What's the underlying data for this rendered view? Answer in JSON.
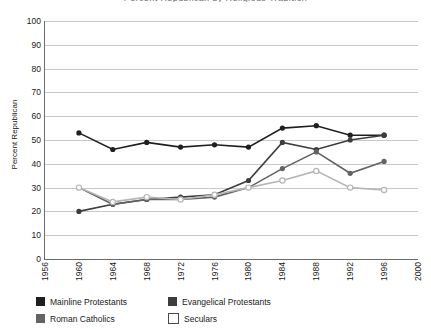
{
  "chart_data": {
    "type": "line",
    "title": "Percent Republican by Religious Tradition",
    "xlabel": "",
    "ylabel": "Percent Republican",
    "x": [
      1960,
      1964,
      1968,
      1972,
      1976,
      1980,
      1984,
      1988,
      1992,
      1996
    ],
    "xlim": [
      1956,
      2000
    ],
    "ylim": [
      0,
      100
    ],
    "xticks": [
      "1956",
      "1960",
      "1964",
      "1968",
      "1972",
      "1976",
      "1980",
      "1984",
      "1988",
      "1992",
      "1996",
      "2000"
    ],
    "yticks": [
      "0",
      "10",
      "20",
      "30",
      "40",
      "50",
      "60",
      "70",
      "80",
      "90",
      "100"
    ],
    "grid": true,
    "legend_position": "bottom-left",
    "series": [
      {
        "name": "Mainline Protestants",
        "color": "#1f1f1f",
        "marker": "filled-circle",
        "values": [
          53,
          46,
          49,
          47,
          48,
          47,
          55,
          56,
          52,
          52
        ]
      },
      {
        "name": "Evangelical Protestants",
        "color": "#3d3d3d",
        "marker": "filled-circle",
        "values": [
          20,
          23,
          25,
          26,
          27,
          33,
          49,
          46,
          50,
          52
        ]
      },
      {
        "name": "Roman Catholics",
        "color": "#636363",
        "marker": "filled-circle",
        "values": [
          30,
          23,
          25,
          25,
          26,
          30,
          38,
          45,
          36,
          41
        ]
      },
      {
        "name": "Seculars",
        "color": "#b5b5b5",
        "marker": "open-circle",
        "values": [
          30,
          24,
          26,
          25,
          27,
          30,
          33,
          37,
          30,
          29
        ]
      }
    ]
  },
  "legend": {
    "items": [
      {
        "label": "Mainline Protestants"
      },
      {
        "label": "Evangelical Protestants"
      },
      {
        "label": "Roman Catholics"
      },
      {
        "label": "Seculars"
      }
    ]
  }
}
